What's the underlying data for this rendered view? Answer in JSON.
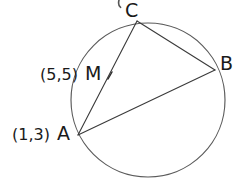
{
  "figure": {
    "kind": "circle-geometry-diagram",
    "background_color": "#ffffff",
    "stroke_color": "#4a4a4a",
    "chord_color": "#3a3a3a",
    "text_color": "#1a1a1a",
    "circle": {
      "name": "circumscribed-circle",
      "cx": 148,
      "cy": 100,
      "r": 77
    },
    "points": {
      "C": {
        "label": "C",
        "x": 137,
        "y": 21
      },
      "B": {
        "label": "B",
        "x": 215,
        "y": 70
      },
      "A": {
        "label": "A",
        "x": 78,
        "y": 135
      },
      "M": {
        "label": "M",
        "x": 110,
        "y": 76
      }
    },
    "coordinates": {
      "M": "(5,5)",
      "A": "(1,3)"
    },
    "chords": [
      {
        "name": "chord-CA",
        "from": "C",
        "to": "A"
      },
      {
        "name": "chord-CB",
        "from": "C",
        "to": "B"
      },
      {
        "name": "chord-AB",
        "from": "A",
        "to": "B"
      }
    ],
    "artifact": {
      "name": "top-crop-artifact",
      "present": true
    }
  }
}
